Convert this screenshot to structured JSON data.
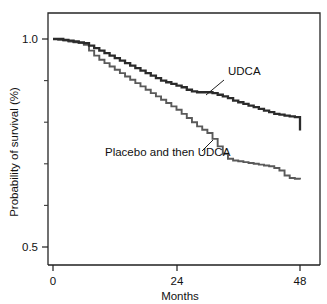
{
  "chart_data": {
    "type": "line",
    "subtype": "kaplan-meier-step",
    "title": "",
    "xlabel": "Months",
    "ylabel": "Probability of survival (%)",
    "xlim": [
      0,
      50
    ],
    "ylim": [
      0.47,
      1.03
    ],
    "grid": false,
    "legend_position": "inline-annotations",
    "x_ticks": [
      0,
      24,
      48
    ],
    "x_tick_labels": [
      "0",
      "24",
      "48"
    ],
    "y_ticks": [
      0.5,
      1.0
    ],
    "y_tick_labels": [
      "0.5",
      "1.0"
    ],
    "y_minor_ticks": [
      0.6,
      0.7,
      0.8,
      0.9
    ],
    "series": [
      {
        "name": "UDCA",
        "color": "#2b2b2b",
        "line_width": 2.3,
        "label_text": "UDCA",
        "x": [
          0,
          1,
          2,
          3,
          4,
          5,
          6,
          7,
          8,
          9,
          10,
          11,
          12,
          13,
          14,
          15,
          16,
          17,
          18,
          19,
          20,
          21,
          22,
          23,
          24,
          25,
          26,
          27,
          28,
          29,
          30,
          31,
          32,
          33,
          34,
          35,
          36,
          37,
          38,
          39,
          40,
          41,
          42,
          43,
          44,
          45,
          46,
          47,
          48
        ],
        "values": [
          1.0,
          1.0,
          0.998,
          0.996,
          0.994,
          0.992,
          0.99,
          0.984,
          0.978,
          0.972,
          0.966,
          0.96,
          0.954,
          0.948,
          0.942,
          0.936,
          0.93,
          0.924,
          0.918,
          0.912,
          0.906,
          0.9,
          0.896,
          0.892,
          0.888,
          0.884,
          0.878,
          0.874,
          0.872,
          0.872,
          0.872,
          0.87,
          0.866,
          0.862,
          0.858,
          0.852,
          0.848,
          0.844,
          0.84,
          0.836,
          0.832,
          0.828,
          0.824,
          0.82,
          0.818,
          0.816,
          0.814,
          0.812,
          0.78
        ]
      },
      {
        "name": "Placebo and then UDCA",
        "color": "#5a5a5a",
        "line_width": 1.9,
        "label_text": "Placebo and then UDCA",
        "x": [
          0,
          1,
          2,
          3,
          4,
          5,
          6,
          7,
          8,
          9,
          10,
          11,
          12,
          13,
          14,
          15,
          16,
          17,
          18,
          19,
          20,
          21,
          22,
          23,
          24,
          25,
          26,
          27,
          28,
          29,
          30,
          31,
          32,
          33,
          34,
          35,
          36,
          37,
          38,
          39,
          40,
          41,
          42,
          43,
          44,
          45,
          46,
          47,
          48
        ],
        "values": [
          1.0,
          0.998,
          0.996,
          0.994,
          0.992,
          0.99,
          0.986,
          0.972,
          0.96,
          0.95,
          0.942,
          0.934,
          0.926,
          0.918,
          0.91,
          0.902,
          0.894,
          0.886,
          0.878,
          0.87,
          0.862,
          0.854,
          0.846,
          0.838,
          0.83,
          0.82,
          0.81,
          0.8,
          0.79,
          0.782,
          0.774,
          0.76,
          0.742,
          0.724,
          0.712,
          0.708,
          0.706,
          0.704,
          0.702,
          0.7,
          0.698,
          0.696,
          0.694,
          0.69,
          0.684,
          0.672,
          0.666,
          0.664,
          0.662
        ]
      }
    ],
    "annotations": [
      {
        "text": "UDCA",
        "x_px": 228,
        "y_px": 75,
        "leader_from_x_px": 224,
        "leader_from_y_px": 80,
        "leader_to_x_px": 206,
        "leader_to_y_px": 95
      },
      {
        "text": "Placebo and then UDCA",
        "x_px": 105,
        "y_px": 156,
        "leader_from_x_px": 202,
        "leader_from_y_px": 151,
        "leader_to_x_px": 213,
        "leader_to_y_px": 140
      }
    ]
  },
  "axes": {
    "x_title": "Months",
    "y_title": "Probability of survival (%)"
  }
}
